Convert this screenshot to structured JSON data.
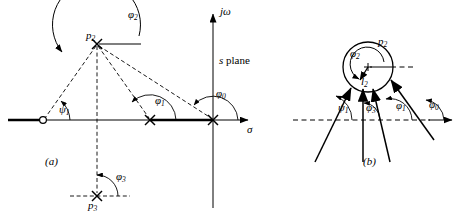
{
  "figure": {
    "background_color": "#ffffff",
    "line_color": "#000000"
  },
  "panel_a": {
    "tag": "(a)",
    "plane_label": "s plane",
    "axis_imaginary_label": "jω",
    "axis_real_label": "σ",
    "points": [
      {
        "name": "zero-z1",
        "marker": "circle",
        "label": "",
        "x": 43,
        "y": 120
      },
      {
        "name": "pole-p1",
        "marker": "cross",
        "label": "",
        "x": 150,
        "y": 120
      },
      {
        "name": "pole-origin",
        "marker": "cross",
        "label": "",
        "x": 213,
        "y": 120
      },
      {
        "name": "pole-p2",
        "marker": "cross",
        "label": "p",
        "sub": "2",
        "x": 97,
        "y": 44
      },
      {
        "name": "pole-p3",
        "marker": "cross",
        "label": "p",
        "sub": "3",
        "x": 97,
        "y": 196
      }
    ],
    "angles": [
      {
        "name": "psi-1",
        "symbol": "ψ",
        "sub": "1"
      },
      {
        "name": "phi-1",
        "symbol": "φ",
        "sub": "1"
      },
      {
        "name": "phi-0",
        "symbol": "φ",
        "sub": "0"
      },
      {
        "name": "phi-2",
        "symbol": "φ",
        "sub": "2"
      },
      {
        "name": "phi-3",
        "symbol": "φ",
        "sub": "3"
      }
    ]
  },
  "panel_b": {
    "tag": "(b)",
    "pole_label": "p",
    "pole_sub": "2",
    "vector_label": "l",
    "vector_sub": "2",
    "angles": [
      {
        "name": "phi-2",
        "symbol": "φ",
        "sub": "2"
      },
      {
        "name": "psi-1",
        "symbol": "ψ",
        "sub": "1"
      },
      {
        "name": "phi-3",
        "symbol": "φ",
        "sub": "3"
      },
      {
        "name": "phi-1",
        "symbol": "φ",
        "sub": "1"
      },
      {
        "name": "phi-0",
        "symbol": "φ",
        "sub": "0"
      }
    ]
  }
}
